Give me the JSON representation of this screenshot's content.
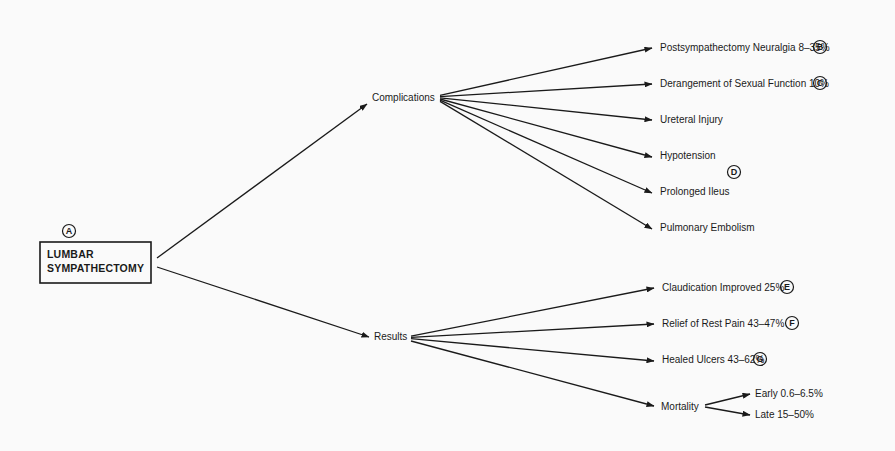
{
  "diagram": {
    "root": {
      "label_lines": [
        "LUMBAR",
        "SYMPATHECTOMY"
      ],
      "badge": "A",
      "box": {
        "x": 40,
        "y": 242,
        "w": 111,
        "h": 41
      },
      "badge_pos": {
        "x": 69,
        "y": 231
      }
    },
    "branches": [
      {
        "id": "complications",
        "label": "Complications",
        "label_pos": {
          "x": 372,
          "y": 101
        },
        "in_arrow": {
          "x1": 157,
          "y1": 258,
          "x2": 367,
          "y2": 104
        },
        "out_origin": {
          "x": 440,
          "y": 99
        },
        "items": [
          {
            "label": "Postsympathectomy Neuralgia 8–35%",
            "x": 660,
            "y": 51,
            "tip": {
              "x": 652,
              "y": 48
            },
            "badge": "B",
            "badge_pos": {
              "x": 820,
              "y": 47
            }
          },
          {
            "label": "Derangement of Sexual Function 10%",
            "x": 660,
            "y": 87,
            "tip": {
              "x": 652,
              "y": 84
            },
            "badge": "C",
            "badge_pos": {
              "x": 820,
              "y": 83
            }
          },
          {
            "label": "Ureteral Injury",
            "x": 660,
            "y": 123,
            "tip": {
              "x": 652,
              "y": 120
            }
          },
          {
            "label": "Hypotension",
            "x": 660,
            "y": 159,
            "tip": {
              "x": 652,
              "y": 157
            }
          },
          {
            "label": "Prolonged Ileus",
            "x": 660,
            "y": 195,
            "tip": {
              "x": 652,
              "y": 193
            }
          },
          {
            "label": "Pulmonary Embolism",
            "x": 660,
            "y": 231,
            "tip": {
              "x": 652,
              "y": 229
            }
          }
        ],
        "extra_badges": [
          {
            "badge": "D",
            "pos": {
              "x": 734,
              "y": 172
            }
          }
        ]
      },
      {
        "id": "results",
        "label": "Results",
        "label_pos": {
          "x": 374,
          "y": 340
        },
        "in_arrow": {
          "x1": 157,
          "y1": 267,
          "x2": 369,
          "y2": 337
        },
        "out_origin": {
          "x": 411,
          "y": 338
        },
        "items": [
          {
            "label": "Claudication Improved 25%",
            "x": 662,
            "y": 291,
            "tip": {
              "x": 654,
              "y": 288
            },
            "badge": "E",
            "badge_pos": {
              "x": 787,
              "y": 287
            }
          },
          {
            "label": "Relief of Rest Pain 43–47%",
            "x": 662,
            "y": 327,
            "tip": {
              "x": 654,
              "y": 324
            },
            "badge": "F",
            "badge_pos": {
              "x": 792,
              "y": 323
            }
          },
          {
            "label": "Healed Ulcers 43–62%",
            "x": 662,
            "y": 363,
            "tip": {
              "x": 654,
              "y": 361
            },
            "badge": "G",
            "badge_pos": {
              "x": 760,
              "y": 359
            }
          }
        ],
        "sub_branch": {
          "label": "Mortality",
          "label_pos": {
            "x": 661,
            "y": 410
          },
          "tip": {
            "x": 654,
            "y": 406
          },
          "out_origin": {
            "x": 705,
            "y": 406
          },
          "items": [
            {
              "label": "Early 0.6–6.5%",
              "x": 755,
              "y": 397,
              "tip": {
                "x": 750,
                "y": 394
              }
            },
            {
              "label": "Late 15–50%",
              "x": 755,
              "y": 418,
              "tip": {
                "x": 750,
                "y": 415
              }
            }
          ]
        }
      }
    ],
    "colors": {
      "ink": "#1a1a1a",
      "paper": "#fafafa"
    }
  }
}
